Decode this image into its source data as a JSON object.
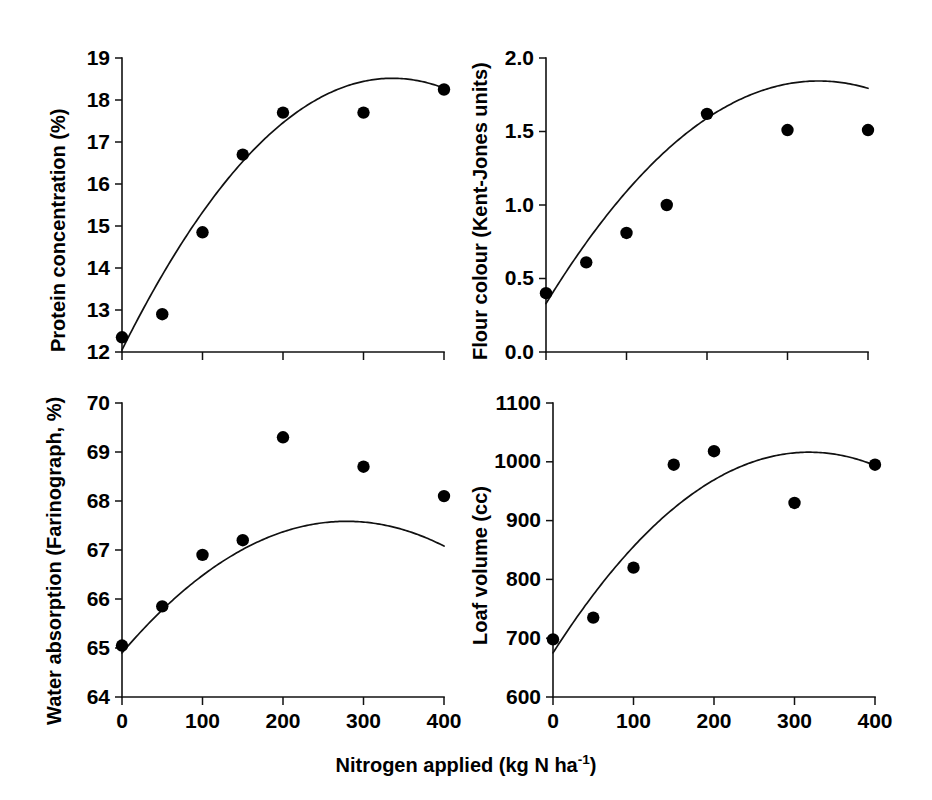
{
  "figure": {
    "xlabel_prefix": "Nitrogen applied (kg N ha",
    "xlabel_sup": "-1",
    "xlabel_suffix": ")",
    "marker_color": "#000000",
    "line_color": "#111111"
  },
  "chart_data": [
    {
      "panel": "top-left",
      "type": "scatter",
      "title": "",
      "xlabel": "Nitrogen applied (kg N ha-1)",
      "ylabel": "Protein concentration (%)",
      "xlim": [
        0,
        400
      ],
      "ylim": [
        12,
        19
      ],
      "xticks": [
        0,
        100,
        200,
        300,
        400
      ],
      "xtick_labels": [
        "0",
        "100",
        "200",
        "300",
        "400"
      ],
      "yticks": [
        12,
        13,
        14,
        15,
        16,
        17,
        18,
        19
      ],
      "ytick_labels": [
        "12",
        "13",
        "14",
        "15",
        "16",
        "17",
        "18",
        "19"
      ],
      "grid": false,
      "legend": "none",
      "x": [
        0,
        50,
        100,
        150,
        200,
        300,
        400
      ],
      "values": [
        12.35,
        12.9,
        14.85,
        16.7,
        17.7,
        17.7,
        18.25
      ],
      "fit": {
        "kind": "quadratic",
        "a": -5.73e-05,
        "b": 0.0385,
        "c": 12.05,
        "x_start": 0,
        "x_end": 400
      }
    },
    {
      "panel": "top-right",
      "type": "scatter",
      "title": "",
      "xlabel": "Nitrogen applied (kg N ha-1)",
      "ylabel": "Flour colour (Kent-Jones units)",
      "xlim": [
        0,
        400
      ],
      "ylim": [
        0.0,
        2.0
      ],
      "xticks": [
        0,
        100,
        200,
        300,
        400
      ],
      "xtick_labels": [
        "0",
        "100",
        "200",
        "300",
        "400"
      ],
      "yticks": [
        0.0,
        0.5,
        1.0,
        1.5,
        2.0
      ],
      "ytick_labels": [
        "0.0",
        "0.5",
        "1.0",
        "1.5",
        "2.0"
      ],
      "grid": false,
      "legend": "none",
      "x": [
        0,
        50,
        100,
        150,
        200,
        300,
        400
      ],
      "values": [
        0.4,
        0.61,
        0.81,
        1.0,
        1.62,
        1.51,
        1.51
      ],
      "fit": {
        "kind": "quadratic",
        "a": -1.32e-05,
        "b": 0.00894,
        "c": 0.33,
        "x_start": 0,
        "x_end": 400
      }
    },
    {
      "panel": "bottom-left",
      "type": "scatter",
      "title": "",
      "xlabel": "Nitrogen applied (kg N ha-1)",
      "ylabel": "Water absorption (Farinograph, %)",
      "xlim": [
        0,
        400
      ],
      "ylim": [
        64,
        70
      ],
      "xticks": [
        0,
        100,
        200,
        300,
        400
      ],
      "xtick_labels": [
        "0",
        "100",
        "200",
        "300",
        "400"
      ],
      "yticks": [
        64,
        65,
        66,
        67,
        68,
        69,
        70
      ],
      "ytick_labels": [
        "64",
        "65",
        "66",
        "67",
        "68",
        "69",
        "70"
      ],
      "grid": false,
      "legend": "none",
      "x": [
        0,
        50,
        100,
        150,
        200,
        300,
        400
      ],
      "values": [
        65.05,
        65.85,
        66.9,
        67.2,
        69.3,
        68.7,
        68.1
      ],
      "fit": {
        "kind": "quadratic",
        "a": -3.45e-05,
        "b": 0.01925,
        "c": 64.9,
        "x_start": 0,
        "x_end": 400
      }
    },
    {
      "panel": "bottom-right",
      "type": "scatter",
      "title": "",
      "xlabel": "Nitrogen applied (kg N ha-1)",
      "ylabel": "Loaf volume (cc)",
      "xlim": [
        0,
        400
      ],
      "ylim": [
        600,
        1100
      ],
      "xticks": [
        0,
        100,
        200,
        300,
        400
      ],
      "xtick_labels": [
        "0",
        "100",
        "200",
        "300",
        "400"
      ],
      "yticks": [
        600,
        700,
        800,
        900,
        1000,
        1100
      ],
      "ytick_labels": [
        "600",
        "700",
        "800",
        "900",
        "1000",
        "1100"
      ],
      "grid": false,
      "legend": "none",
      "x": [
        0,
        50,
        100,
        150,
        200,
        300,
        400
      ],
      "values": [
        698,
        735,
        820,
        995,
        1018,
        930,
        995
      ],
      "fit": {
        "kind": "quadratic",
        "a": -0.00337,
        "b": 2.145,
        "c": 675,
        "x_start": 0,
        "x_end": 400
      }
    }
  ]
}
